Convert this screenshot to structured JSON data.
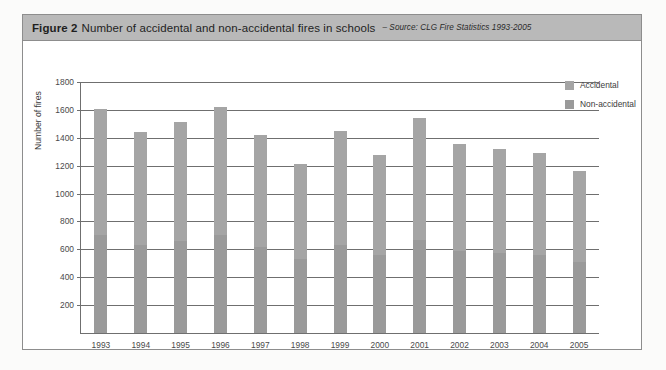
{
  "figure": {
    "label": "Figure 2",
    "title": "Number of accidental and non-accidental fires in schools",
    "source": "– Source: CLG Fire Statistics 1993-2005"
  },
  "legend": {
    "position": "top-right",
    "items": [
      {
        "label": "Accidental",
        "color": "#a5a5a5"
      },
      {
        "label": "Non-accidental",
        "color": "#9a9a9a"
      }
    ]
  },
  "chart_data": {
    "type": "bar",
    "title": "Number of accidental and non-accidental fires in schools",
    "subtitle": "– Source: CLG Fire Statistics 1993-2005",
    "xlabel": "",
    "ylabel": "Number of fires",
    "categories": [
      "1993",
      "1994",
      "1995",
      "1996",
      "1997",
      "1998",
      "1999",
      "2000",
      "2001",
      "2002",
      "2003",
      "2004",
      "2005"
    ],
    "values": [
      1610,
      1445,
      1515,
      1620,
      1420,
      1215,
      1450,
      1280,
      1545,
      1355,
      1320,
      1290,
      1165
    ],
    "series": [
      {
        "name": "Accidental",
        "color": "#a5a5a5",
        "values": [
          910,
          815,
          855,
          915,
          800,
          685,
          820,
          720,
          875,
          765,
          745,
          730,
          655
        ]
      },
      {
        "name": "Non-accidental",
        "color": "#9a9a9a",
        "values": [
          700,
          630,
          660,
          705,
          620,
          530,
          630,
          560,
          670,
          590,
          575,
          560,
          510
        ]
      }
    ],
    "ylim": [
      0,
      1800
    ],
    "yticks": [
      200,
      400,
      600,
      800,
      1000,
      1200,
      1400,
      1600,
      1800
    ],
    "ytick_labels": [
      "200",
      "400",
      "600",
      "800",
      "1000",
      "1200",
      "1400",
      "1600",
      "1800"
    ],
    "grid": true,
    "stacked": true
  },
  "colors": {
    "caption_bar": "#b9b9b9",
    "box_border": "#8d8d8d",
    "axis": "#6f6f6f",
    "bar": "#9e9e9e",
    "page_background": "#fbfbfa"
  }
}
